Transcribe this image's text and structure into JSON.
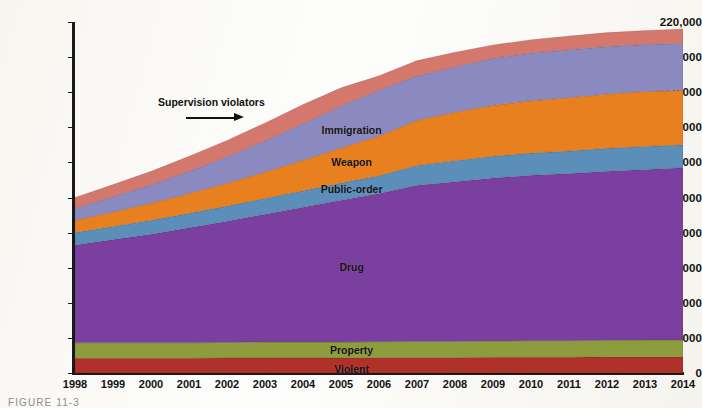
{
  "figure": {
    "caption": "FIGURE 11-3"
  },
  "annotation": {
    "text": "Supervision violators",
    "arrow": "right-arrow-icon"
  },
  "axes": {
    "y_tick_labels": [
      "220,000",
      "180,000",
      "150,000",
      "130,000",
      "110,000",
      "90,000",
      "70,000",
      "50,000",
      "30,000",
      "10,000",
      "0"
    ],
    "y_tick_values": [
      220000,
      180000,
      150000,
      130000,
      110000,
      90000,
      70000,
      50000,
      30000,
      10000,
      0
    ],
    "x_tick_labels": [
      "1998",
      "1999",
      "2000",
      "2001",
      "2002",
      "2003",
      "2004",
      "2005",
      "2006",
      "2007",
      "2008",
      "2009",
      "2010",
      "2011",
      "2012",
      "2013",
      "2014"
    ]
  },
  "colors": {
    "violent": "#b0302a",
    "property": "#8d9c3c",
    "drug": "#7b3fa0",
    "public_order": "#5b8fb9",
    "weapon": "#e8801f",
    "immigration": "#8b8ac0",
    "supervision_violators": "#d4786e",
    "axis": "#1a1a1a",
    "background": "#fdfdfb"
  },
  "chart_data": {
    "type": "area",
    "title": "",
    "subtitle": "",
    "xlabel": "",
    "ylabel": "",
    "stacked": true,
    "grid": false,
    "legend_position": "inline-labels",
    "annotations": [
      {
        "text": "Supervision violators",
        "points_to": "supervision-violators-band"
      }
    ],
    "axis_note": "Y axis uses non-uniform value spacing: ticks at 0, 10000, 30000, 50000, 70000, 90000, 110000, 130000, 150000, 180000, 220000 are evenly spaced in pixels.",
    "ylim": [
      0,
      220000
    ],
    "x": [
      1998,
      1999,
      2000,
      2001,
      2002,
      2003,
      2004,
      2005,
      2006,
      2007,
      2008,
      2009,
      2010,
      2011,
      2012,
      2013,
      2014
    ],
    "categories": [
      "1998",
      "1999",
      "2000",
      "2001",
      "2002",
      "2003",
      "2004",
      "2005",
      "2006",
      "2007",
      "2008",
      "2009",
      "2010",
      "2011",
      "2012",
      "2013",
      "2014"
    ],
    "series": [
      {
        "name": "Violent",
        "label": "Violent",
        "color": "#b0302a",
        "values": [
          4200,
          4200,
          4200,
          4200,
          4300,
          4300,
          4300,
          4300,
          4400,
          4400,
          4400,
          4500,
          4500,
          4500,
          4600,
          4600,
          4600
        ]
      },
      {
        "name": "Property",
        "label": "Property",
        "color": "#8d9c3c",
        "values": [
          4400,
          4400,
          4400,
          4400,
          4400,
          4500,
          4500,
          4500,
          4500,
          4600,
          4600,
          4600,
          4700,
          4700,
          4700,
          4800,
          4800
        ]
      },
      {
        "name": "Drug",
        "label": "Drug",
        "color": "#7b3fa0",
        "values": [
          54400,
          57400,
          60400,
          64100,
          67800,
          71700,
          75700,
          79700,
          83400,
          88000,
          90000,
          92000,
          93500,
          94500,
          95700,
          96600,
          97600
        ]
      },
      {
        "name": "Public-order",
        "label": "Public-order",
        "color": "#5b8fb9",
        "values": [
          7000,
          7500,
          8000,
          8300,
          8600,
          9000,
          9300,
          9700,
          10100,
          11300,
          12000,
          12400,
          12600,
          12800,
          13000,
          13100,
          13000
        ]
      },
      {
        "name": "Weapon",
        "label": "Weapon",
        "color": "#e8801f",
        "values": [
          7000,
          8300,
          9700,
          11300,
          13000,
          15000,
          17400,
          20000,
          22600,
          25700,
          27600,
          29000,
          29800,
          30400,
          31000,
          31400,
          31600
        ]
      },
      {
        "name": "Immigration",
        "label": "Immigration",
        "color": "#8b8ac0",
        "values": [
          6800,
          8600,
          10400,
          12600,
          15000,
          17800,
          20800,
          23800,
          26700,
          29800,
          33000,
          36500,
          39500,
          41500,
          43000,
          43800,
          44200
        ]
      },
      {
        "name": "Supervision violators",
        "label": "",
        "color": "#d4786e",
        "values": [
          6200,
          7000,
          7800,
          8600,
          9400,
          10200,
          11000,
          11700,
          12400,
          13200,
          14000,
          14800,
          15300,
          15600,
          15900,
          16100,
          16200
        ]
      }
    ],
    "totals": [
      90000,
      97400,
      105300,
      113500,
      122500,
      132500,
      143000,
      153700,
      164100,
      176900,
      186600,
      194800,
      200900,
      204000,
      207900,
      210400,
      212000
    ],
    "series_labels": [
      {
        "name": "Immigration",
        "x_pct": 45.5,
        "y_px": 130
      },
      {
        "name": "Weapon",
        "x_pct": 45.5,
        "y_px": 162
      },
      {
        "name": "Public-order",
        "x_pct": 45.5,
        "y_px": 189
      },
      {
        "name": "Drug",
        "x_pct": 45.5,
        "y_px": 267
      },
      {
        "name": "Property",
        "x_pct": 45.5,
        "y_px": 350
      },
      {
        "name": "Violent",
        "x_pct": 45.5,
        "y_px": 369
      }
    ]
  }
}
